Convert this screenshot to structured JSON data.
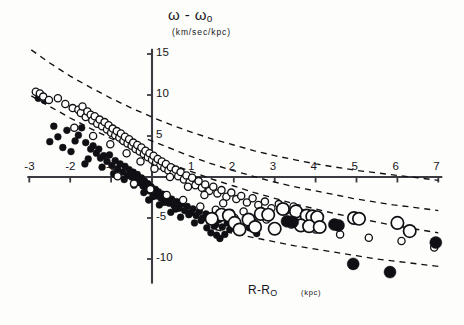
{
  "chart_data": {
    "type": "scatter",
    "title": "",
    "xlabel": "R-R",
    "xlabel_sub": "O",
    "xunits": "(kpc)",
    "ylabel": "ω - ω",
    "ylabel_sub": "o",
    "yunits": "(km/sec/kpc)",
    "xlim": [
      -3,
      7
    ],
    "ylim": [
      -13,
      16
    ],
    "xticks": [
      -3,
      -2,
      -1,
      1,
      2,
      3,
      4,
      5,
      6,
      7
    ],
    "yticks": [
      15,
      10,
      5,
      -5,
      -10
    ],
    "xtick_labels": [
      "-3",
      "-2",
      "-1",
      "1",
      "2",
      "3",
      "4",
      "5",
      "6",
      "7"
    ],
    "ytick_labels": [
      "15",
      "10",
      "5",
      "-5",
      "-10"
    ],
    "grid": false,
    "legend": "none",
    "axis_color": "#3a3a40",
    "marker_color": "#101014",
    "series": [
      {
        "name": "small-filled-dot",
        "marker": "filled-circle",
        "size": 3.4,
        "points": [
          [
            -2.78,
            9.6
          ],
          [
            -2.62,
            9.3
          ],
          [
            -2.4,
            6.2
          ],
          [
            -2.08,
            5.7
          ],
          [
            -1.88,
            4.4
          ],
          [
            -1.8,
            5.1
          ],
          [
            -1.72,
            6.0
          ],
          [
            -1.62,
            4.2
          ],
          [
            -1.5,
            3.4
          ],
          [
            -1.44,
            3.8
          ],
          [
            -1.36,
            2.9
          ],
          [
            -1.3,
            3.4
          ],
          [
            -1.26,
            2.3
          ],
          [
            -1.18,
            2.6
          ],
          [
            -1.1,
            1.9
          ],
          [
            -1.04,
            2.7
          ],
          [
            -0.98,
            1.4
          ],
          [
            -0.9,
            2.0
          ],
          [
            -0.84,
            1.0
          ],
          [
            -0.78,
            1.6
          ],
          [
            -0.72,
            0.6
          ],
          [
            -0.66,
            1.3
          ],
          [
            -0.6,
            0.2
          ],
          [
            -0.56,
            0.9
          ],
          [
            -0.5,
            0.0
          ],
          [
            -0.46,
            0.6
          ],
          [
            -0.4,
            -0.4
          ],
          [
            -0.36,
            0.3
          ],
          [
            -0.3,
            -0.7
          ],
          [
            -0.26,
            -0.1
          ],
          [
            -0.22,
            -1.1
          ],
          [
            -0.18,
            -0.5
          ],
          [
            -0.14,
            -1.4
          ],
          [
            -0.1,
            -0.8
          ],
          [
            -0.06,
            -1.7
          ],
          [
            -0.02,
            -1.2
          ],
          [
            0.04,
            -2.0
          ],
          [
            0.08,
            -1.5
          ],
          [
            0.12,
            -2.3
          ],
          [
            0.16,
            -1.8
          ],
          [
            0.22,
            -2.6
          ],
          [
            0.26,
            -2.1
          ],
          [
            0.32,
            -2.9
          ],
          [
            0.36,
            -2.4
          ],
          [
            0.42,
            -3.2
          ],
          [
            0.48,
            -2.7
          ],
          [
            0.54,
            -3.5
          ],
          [
            0.6,
            -3.0
          ],
          [
            0.66,
            -3.8
          ],
          [
            0.72,
            -3.3
          ],
          [
            0.8,
            -4.1
          ],
          [
            0.86,
            -3.6
          ],
          [
            0.94,
            -4.4
          ],
          [
            1.0,
            -3.9
          ],
          [
            1.08,
            -4.7
          ],
          [
            1.16,
            -4.2
          ],
          [
            1.24,
            -5.0
          ],
          [
            1.32,
            -4.5
          ],
          [
            1.4,
            -5.4
          ],
          [
            1.48,
            -4.8
          ],
          [
            1.56,
            -5.8
          ],
          [
            1.64,
            -5.2
          ],
          [
            1.72,
            -6.1
          ],
          [
            1.84,
            -5.6
          ],
          [
            -2.3,
            4.9
          ],
          [
            -1.98,
            3.1
          ],
          [
            -1.56,
            2.2
          ],
          [
            -1.22,
            1.2
          ],
          [
            -0.94,
            0.4
          ],
          [
            -0.68,
            -0.3
          ],
          [
            -0.44,
            -1.0
          ],
          [
            -0.2,
            -1.9
          ],
          [
            0.02,
            -2.4
          ],
          [
            0.3,
            -3.1
          ],
          [
            0.58,
            -3.9
          ],
          [
            0.9,
            -4.6
          ],
          [
            1.2,
            -5.3
          ],
          [
            1.52,
            -6.0
          ],
          [
            1.9,
            -6.4
          ],
          [
            2.06,
            -5.9
          ],
          [
            2.2,
            -6.6
          ],
          [
            2.38,
            -6.2
          ],
          [
            2.56,
            -6.9
          ],
          [
            1.34,
            -6.2
          ],
          [
            1.44,
            -6.8
          ],
          [
            1.58,
            -7.1
          ],
          [
            1.66,
            -7.5
          ],
          [
            1.78,
            -7.0
          ],
          [
            0.46,
            -4.3
          ],
          [
            0.7,
            -4.9
          ],
          [
            1.04,
            -5.6
          ],
          [
            -1.64,
            1.6
          ],
          [
            -2.18,
            3.6
          ],
          [
            -2.5,
            4.3
          ],
          [
            0.18,
            -3.4
          ],
          [
            -0.08,
            -2.8
          ]
        ]
      },
      {
        "name": "small-open-circle",
        "marker": "open-circle",
        "size": 3.6,
        "points": [
          [
            -2.84,
            10.4
          ],
          [
            -2.74,
            10.2
          ],
          [
            -2.66,
            9.8
          ],
          [
            -2.52,
            9.4
          ],
          [
            -2.3,
            9.6
          ],
          [
            -2.12,
            8.9
          ],
          [
            -1.94,
            8.4
          ],
          [
            -1.8,
            8.2
          ],
          [
            -1.74,
            7.8
          ],
          [
            -1.7,
            8.6
          ],
          [
            -1.62,
            7.3
          ],
          [
            -1.58,
            8.0
          ],
          [
            -1.5,
            7.6
          ],
          [
            -1.46,
            6.9
          ],
          [
            -1.4,
            7.4
          ],
          [
            -1.34,
            6.5
          ],
          [
            -1.28,
            7.0
          ],
          [
            -1.22,
            6.2
          ],
          [
            -1.16,
            6.7
          ],
          [
            -1.1,
            5.8
          ],
          [
            -1.06,
            6.3
          ],
          [
            -1.0,
            5.4
          ],
          [
            -0.96,
            5.9
          ],
          [
            -0.9,
            5.1
          ],
          [
            -0.86,
            5.6
          ],
          [
            -0.8,
            4.8
          ],
          [
            -0.76,
            5.3
          ],
          [
            -0.7,
            4.4
          ],
          [
            -0.66,
            4.9
          ],
          [
            -0.6,
            4.1
          ],
          [
            -0.56,
            4.6
          ],
          [
            -0.5,
            3.8
          ],
          [
            -0.46,
            4.2
          ],
          [
            -0.4,
            3.4
          ],
          [
            -0.36,
            3.9
          ],
          [
            -0.3,
            3.1
          ],
          [
            -0.26,
            3.6
          ],
          [
            -0.2,
            2.8
          ],
          [
            -0.16,
            3.2
          ],
          [
            -0.1,
            2.4
          ],
          [
            -0.06,
            2.9
          ],
          [
            0.0,
            2.1
          ],
          [
            0.04,
            2.6
          ],
          [
            0.1,
            1.8
          ],
          [
            0.14,
            2.2
          ],
          [
            0.2,
            1.4
          ],
          [
            0.24,
            1.9
          ],
          [
            0.3,
            1.1
          ],
          [
            0.34,
            1.6
          ],
          [
            0.4,
            0.8
          ],
          [
            0.46,
            1.2
          ],
          [
            0.52,
            0.4
          ],
          [
            0.58,
            0.9
          ],
          [
            0.64,
            0.1
          ],
          [
            0.7,
            0.6
          ],
          [
            0.78,
            -0.3
          ],
          [
            0.84,
            0.2
          ],
          [
            0.92,
            -0.6
          ],
          [
            0.98,
            -0.1
          ],
          [
            1.06,
            -1.0
          ],
          [
            1.14,
            -0.5
          ],
          [
            1.22,
            -1.3
          ],
          [
            1.3,
            -0.9
          ],
          [
            1.4,
            -1.7
          ],
          [
            1.5,
            -1.2
          ],
          [
            1.6,
            -2.0
          ],
          [
            1.7,
            -1.6
          ],
          [
            1.82,
            -2.4
          ],
          [
            1.94,
            -1.9
          ],
          [
            2.06,
            -2.7
          ],
          [
            2.18,
            -2.3
          ],
          [
            2.32,
            -3.1
          ],
          [
            2.46,
            -2.6
          ],
          [
            2.6,
            -3.4
          ],
          [
            2.76,
            -3.0
          ],
          [
            2.92,
            -3.8
          ],
          [
            3.1,
            -3.3
          ],
          [
            3.28,
            -4.1
          ],
          [
            3.46,
            -3.6
          ],
          [
            3.66,
            -4.4
          ],
          [
            -1.9,
            6.0
          ],
          [
            -1.44,
            5.0
          ],
          [
            -1.02,
            4.0
          ],
          [
            -0.62,
            2.9
          ],
          [
            -0.28,
            1.9
          ],
          [
            0.06,
            1.0
          ],
          [
            0.44,
            0.0
          ],
          [
            0.88,
            -1.2
          ],
          [
            1.28,
            -2.2
          ],
          [
            1.74,
            -3.2
          ],
          [
            2.24,
            -4.2
          ],
          [
            2.8,
            -5.2
          ],
          [
            3.4,
            -5.8
          ],
          [
            4.0,
            -6.4
          ],
          [
            4.6,
            -7.0
          ],
          [
            5.3,
            -7.4
          ],
          [
            6.1,
            -7.8
          ],
          [
            6.9,
            -8.6
          ],
          [
            2.02,
            -5.0
          ],
          [
            2.5,
            -5.6
          ],
          [
            1.92,
            -4.4
          ],
          [
            1.56,
            -4.0
          ],
          [
            1.18,
            -3.6
          ],
          [
            0.76,
            -2.8
          ],
          [
            0.36,
            -2.2
          ],
          [
            -0.04,
            -1.5
          ],
          [
            -0.44,
            -0.8
          ],
          [
            -0.84,
            0.1
          ]
        ]
      },
      {
        "name": "large-open-circle",
        "marker": "open-circle",
        "size": 6.2,
        "points": [
          [
            1.7,
            -4.6
          ],
          [
            1.88,
            -4.7
          ],
          [
            2.02,
            -5.6
          ],
          [
            2.36,
            -5.2
          ],
          [
            2.66,
            -4.5
          ],
          [
            2.84,
            -4.6
          ],
          [
            3.2,
            -3.9
          ],
          [
            3.52,
            -4.2
          ],
          [
            3.78,
            -4.7
          ],
          [
            3.92,
            -4.8
          ],
          [
            4.04,
            -4.9
          ],
          [
            3.64,
            -5.9
          ],
          [
            3.84,
            -6.0
          ],
          [
            4.1,
            -6.1
          ],
          [
            4.94,
            -5.0
          ],
          [
            5.06,
            -5.1
          ],
          [
            6.0,
            -5.6
          ],
          [
            6.3,
            -6.6
          ],
          [
            2.52,
            -6.1
          ],
          [
            3.0,
            -6.3
          ],
          [
            1.46,
            -5.1
          ],
          [
            2.14,
            -6.4
          ]
        ]
      },
      {
        "name": "large-filled-circle",
        "marker": "filled-circle",
        "size": 6.0,
        "points": [
          [
            3.3,
            -5.4
          ],
          [
            3.44,
            -5.5
          ],
          [
            4.46,
            -5.8
          ],
          [
            4.56,
            -5.9
          ],
          [
            4.92,
            -10.6
          ],
          [
            5.82,
            -11.6
          ],
          [
            6.94,
            -8.0
          ]
        ]
      }
    ],
    "curves": [
      {
        "name": "upper-dashed-envelope",
        "style": "dashed",
        "points": [
          [
            -2.95,
            15.5
          ],
          [
            -2.5,
            13.9
          ],
          [
            -2.0,
            12.3
          ],
          [
            -1.5,
            10.9
          ],
          [
            -1.0,
            9.6
          ],
          [
            -0.5,
            8.4
          ],
          [
            0.0,
            7.3
          ],
          [
            0.5,
            6.3
          ],
          [
            1.0,
            5.4
          ],
          [
            1.5,
            4.6
          ],
          [
            2.0,
            3.9
          ],
          [
            2.5,
            3.2
          ],
          [
            3.0,
            2.6
          ],
          [
            3.5,
            2.1
          ],
          [
            4.0,
            1.6
          ],
          [
            4.5,
            1.2
          ],
          [
            5.0,
            0.8
          ],
          [
            5.5,
            0.5
          ],
          [
            6.0,
            0.2
          ],
          [
            6.5,
            -0.1
          ],
          [
            7.0,
            -0.4
          ]
        ]
      },
      {
        "name": "mid-dashed-envelope",
        "style": "dashed",
        "points": [
          [
            -0.1,
            4.6
          ],
          [
            0.4,
            3.6
          ],
          [
            0.9,
            2.6
          ],
          [
            1.4,
            1.7
          ],
          [
            1.9,
            0.9
          ],
          [
            2.4,
            0.2
          ],
          [
            2.9,
            -0.5
          ],
          [
            3.4,
            -1.1
          ],
          [
            3.9,
            -1.6
          ],
          [
            4.4,
            -2.1
          ],
          [
            4.9,
            -2.6
          ],
          [
            5.4,
            -3.0
          ],
          [
            5.9,
            -3.4
          ],
          [
            6.4,
            -3.7
          ],
          [
            7.0,
            -4.1
          ]
        ]
      },
      {
        "name": "lower-dashed-envelope",
        "style": "dashed",
        "points": [
          [
            -2.95,
            9.9
          ],
          [
            -2.5,
            8.6
          ],
          [
            -2.0,
            7.2
          ],
          [
            -1.5,
            5.9
          ],
          [
            -1.0,
            4.7
          ],
          [
            -0.5,
            3.6
          ],
          [
            0.0,
            2.5
          ],
          [
            0.5,
            1.5
          ],
          [
            1.0,
            0.6
          ],
          [
            1.5,
            -0.3
          ],
          [
            2.0,
            -1.1
          ],
          [
            2.5,
            -1.9
          ],
          [
            3.0,
            -2.6
          ],
          [
            3.5,
            -3.3
          ],
          [
            4.0,
            -3.9
          ],
          [
            4.5,
            -4.5
          ],
          [
            5.0,
            -5.0
          ],
          [
            5.5,
            -5.5
          ],
          [
            6.0,
            -6.0
          ],
          [
            6.5,
            -6.4
          ],
          [
            7.0,
            -6.8
          ]
        ]
      },
      {
        "name": "bottom-dashed-envelope",
        "style": "dashed",
        "points": [
          [
            1.55,
            -6.4
          ],
          [
            2.0,
            -6.9
          ],
          [
            2.5,
            -7.4
          ],
          [
            3.0,
            -7.9
          ],
          [
            3.5,
            -8.4
          ],
          [
            4.0,
            -8.8
          ],
          [
            4.5,
            -9.2
          ],
          [
            5.0,
            -9.6
          ],
          [
            5.5,
            -10.0
          ],
          [
            6.0,
            -10.3
          ],
          [
            6.5,
            -10.6
          ],
          [
            7.0,
            -10.9
          ]
        ]
      }
    ]
  }
}
